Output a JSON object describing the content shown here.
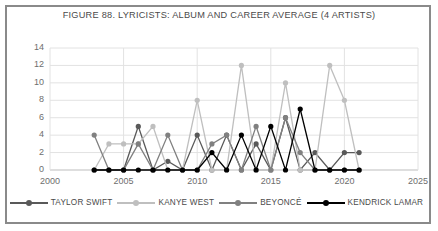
{
  "chart_data": {
    "type": "line",
    "title": "FIGURE 88. LYRICISTS: ALBUM AND CAREER AVERAGE (4 ARTISTS)",
    "xlabel": "",
    "ylabel": "",
    "xlim": [
      2000,
      2025
    ],
    "ylim": [
      0,
      14
    ],
    "xticks": [
      2000,
      2005,
      2010,
      2015,
      2020,
      2025
    ],
    "yticks": [
      0,
      2,
      4,
      6,
      8,
      10,
      12,
      14
    ],
    "grid": "horizontal-and-vertical",
    "legend_position": "bottom",
    "x": [
      2003,
      2004,
      2005,
      2006,
      2007,
      2008,
      2009,
      2010,
      2011,
      2012,
      2013,
      2014,
      2015,
      2016,
      2017,
      2018,
      2019,
      2020,
      2021
    ],
    "series": [
      {
        "name": "TAYLOR SWIFT",
        "color": "#595959",
        "values": [
          0,
          0,
          0,
          5,
          0,
          1,
          0,
          4,
          0,
          4,
          0,
          3,
          0,
          6,
          0,
          2,
          0,
          2,
          2
        ]
      },
      {
        "name": "KANYE WEST",
        "color": "#bfbfbf",
        "values": [
          0,
          3,
          3,
          3,
          5,
          0,
          0,
          8,
          0,
          0,
          12,
          0,
          0,
          10,
          0,
          0,
          12,
          8,
          0
        ]
      },
      {
        "name": "BEYONCÉ",
        "color": "#808080",
        "values": [
          4,
          0,
          0,
          3,
          0,
          4,
          0,
          0,
          3,
          4,
          0,
          5,
          0,
          6,
          2,
          0,
          0,
          0,
          0
        ]
      },
      {
        "name": "KENDRICK LAMAR",
        "color": "#000000",
        "values": [
          0,
          0,
          0,
          0,
          0,
          0,
          0,
          0,
          2,
          0,
          4,
          0,
          5,
          0,
          7,
          0,
          0,
          0,
          0
        ]
      }
    ]
  },
  "legend": {
    "items": [
      {
        "label": "TAYLOR SWIFT",
        "color": "#595959"
      },
      {
        "label": "KANYE WEST",
        "color": "#bfbfbf"
      },
      {
        "label": "BEYONCÉ",
        "color": "#808080"
      },
      {
        "label": "KENDRICK LAMAR",
        "color": "#000000"
      }
    ]
  }
}
